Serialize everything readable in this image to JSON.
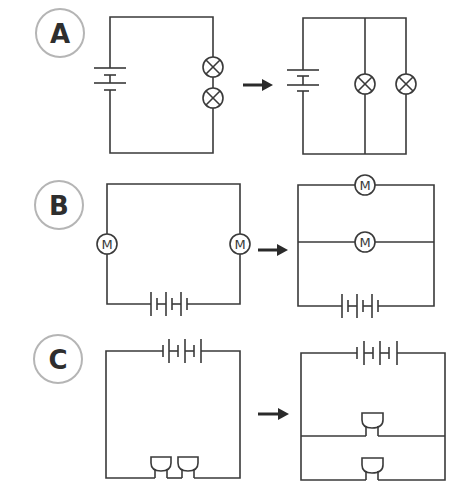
{
  "panels": [
    {
      "label": "A",
      "before": {
        "description": "Series circuit: battery with two lamps in series",
        "components": [
          "battery",
          "lamp",
          "lamp"
        ]
      },
      "after": {
        "description": "Parallel circuit: battery with two lamps in parallel",
        "components": [
          "battery",
          "lamp",
          "lamp"
        ]
      }
    },
    {
      "label": "B",
      "before": {
        "description": "Series circuit: 3-cell battery with two motors in series",
        "components": [
          "battery-3cell",
          "motor",
          "motor"
        ]
      },
      "after": {
        "description": "Parallel circuit: 3-cell battery with two motors in parallel",
        "components": [
          "battery-3cell",
          "motor",
          "motor"
        ]
      }
    },
    {
      "label": "C",
      "before": {
        "description": "Series circuit: 3-cell battery with two buzzers in series",
        "components": [
          "battery-3cell",
          "buzzer",
          "buzzer"
        ]
      },
      "after": {
        "description": "Parallel circuit: 3-cell battery with two buzzers in parallel",
        "components": [
          "battery-3cell",
          "buzzer",
          "buzzer"
        ]
      }
    }
  ],
  "motor_symbol": "M",
  "colors": {
    "wire": "#3a3a3a",
    "label_ring": "#b5b5b5",
    "label_text": "#2e2e2e",
    "arrow": "#2a2a2a"
  }
}
